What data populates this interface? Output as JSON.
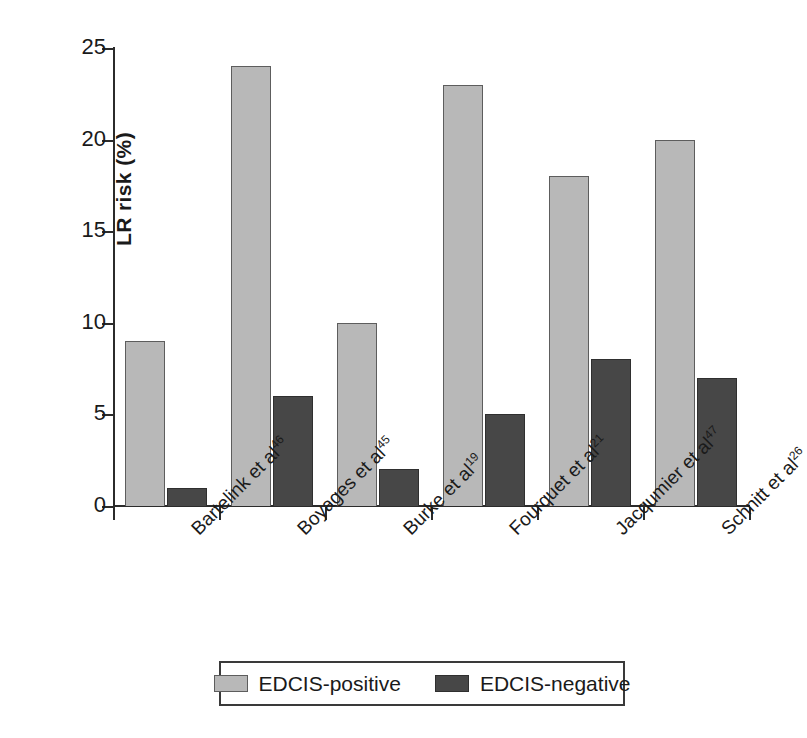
{
  "chart_data": {
    "type": "bar",
    "title": "",
    "xlabel": "",
    "ylabel": "LR risk (%)",
    "ylim": [
      0,
      25
    ],
    "yticks": [
      0,
      5,
      10,
      15,
      20,
      25
    ],
    "ytick_labels": [
      "0",
      "5",
      "10",
      "15",
      "20",
      "25"
    ],
    "grid": false,
    "legend_position": "bottom",
    "categories": [
      "Bartelink et al46",
      "Boyages et al45",
      "Burke et al19",
      "Fourquet et al21",
      "Jacqumier et al47",
      "Schnitt et al26"
    ],
    "category_parts": [
      {
        "name": "Bartelink et al",
        "ref": "46"
      },
      {
        "name": "Boyages et al",
        "ref": "45"
      },
      {
        "name": "Burke et al",
        "ref": "19"
      },
      {
        "name": "Fourquet et al",
        "ref": "21"
      },
      {
        "name": "Jacqumier et al",
        "ref": "47"
      },
      {
        "name": "Schnitt et al",
        "ref": "26"
      }
    ],
    "series": [
      {
        "name": "EDCIS-positive",
        "color": "#b8b8b8",
        "values": [
          9,
          24,
          10,
          23,
          18,
          20
        ]
      },
      {
        "name": "EDCIS-negative",
        "color": "#474747",
        "values": [
          1,
          6,
          2,
          5,
          8,
          7
        ]
      }
    ]
  },
  "legend": {
    "items": [
      {
        "label": "EDCIS-positive",
        "swatch": "pos"
      },
      {
        "label": "EDCIS-negative",
        "swatch": "neg"
      }
    ]
  },
  "colors": {
    "positive": "#b8b8b8",
    "negative": "#474747",
    "axis": "#2b2b2b",
    "background": "#ffffff"
  }
}
